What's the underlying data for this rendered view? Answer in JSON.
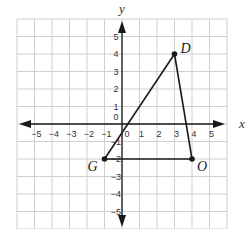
{
  "diagram": {
    "type": "coordinate-plane",
    "axes": {
      "x_label": "x",
      "y_label": "y",
      "x_range": [
        -5,
        5
      ],
      "y_range": [
        -5,
        5
      ],
      "x_ticks": [
        "−5",
        "−4",
        "−3",
        "−2",
        "−1",
        "0",
        "1",
        "2",
        "3",
        "4",
        "5"
      ],
      "y_ticks": [
        "5",
        "4",
        "3",
        "2",
        "1",
        "0",
        "−1",
        "−2",
        "−3",
        "−4",
        "−5"
      ],
      "grid": true
    },
    "points": [
      {
        "label": "D",
        "x": 3,
        "y": 4
      },
      {
        "label": "G",
        "x": -1,
        "y": -2
      },
      {
        "label": "O",
        "x": 4,
        "y": -2
      }
    ],
    "segments": [
      [
        "G",
        "D"
      ],
      [
        "D",
        "O"
      ],
      [
        "O",
        "G"
      ]
    ],
    "colors": {
      "grid": "#cfcfcf",
      "axis": "#1a1a1a",
      "shape": "#1a1a1a",
      "text": "#333333"
    }
  }
}
